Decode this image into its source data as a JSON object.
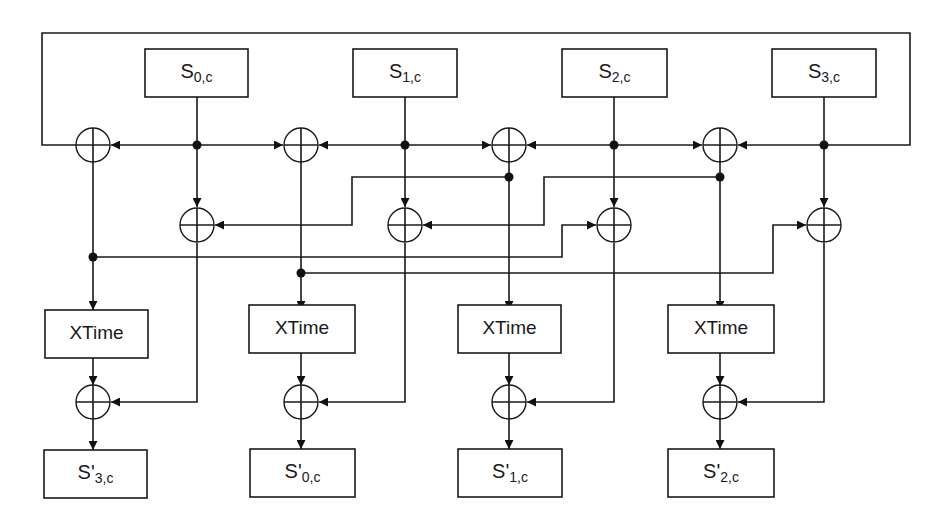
{
  "diagram": {
    "inputs": [
      {
        "main": "S",
        "sub": "0,c"
      },
      {
        "main": "S",
        "sub": "1,c"
      },
      {
        "main": "S",
        "sub": "2,c"
      },
      {
        "main": "S",
        "sub": "3,c"
      }
    ],
    "xtime_label": "XTime",
    "xtime_blocks": [
      {
        "label": "XTime"
      },
      {
        "label": "XTime"
      },
      {
        "label": "XTime"
      },
      {
        "label": "XTime"
      }
    ],
    "outputs": [
      {
        "main": "S'",
        "sub": "3,c"
      },
      {
        "main": "S'",
        "sub": "0,c"
      },
      {
        "main": "S'",
        "sub": "1,c"
      },
      {
        "main": "S'",
        "sub": "2,c"
      }
    ],
    "xor_symbol": "⊕",
    "colors": {
      "line": "#1a1a1a",
      "background": "#ffffff"
    }
  }
}
